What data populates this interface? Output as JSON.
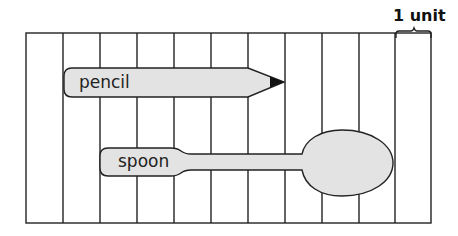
{
  "diagram": {
    "unit_label": "1 unit",
    "columns": 11,
    "objects": [
      {
        "name": "pencil",
        "label": "pencil",
        "length_units": 6
      },
      {
        "name": "spoon",
        "label": "spoon",
        "length_units": 8
      }
    ],
    "colors": {
      "fill": "#e3e3e3",
      "stroke": "#222222",
      "tip": "#111111"
    }
  }
}
